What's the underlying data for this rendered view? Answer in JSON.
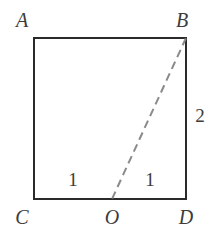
{
  "figure": {
    "background_color": "#ffffff",
    "stroke_color": "#2a2a2a",
    "dashed_stroke_color": "#8a8a8a",
    "label_color": "#3c3c3c",
    "square": {
      "x": 34,
      "y": 38,
      "width": 152,
      "height": 161,
      "stroke_width": 2.2
    },
    "dashed_segment": {
      "from": "B",
      "to": "O",
      "x1": 186,
      "y1": 38,
      "x2": 112,
      "y2": 199,
      "stroke_width": 2,
      "dash_length": 8,
      "gap_length": 5
    },
    "points": {
      "A": {
        "x": 34,
        "y": 38
      },
      "B": {
        "x": 186,
        "y": 38
      },
      "C": {
        "x": 34,
        "y": 199
      },
      "D": {
        "x": 186,
        "y": 199
      },
      "O": {
        "x": 112,
        "y": 199
      }
    }
  },
  "labels": {
    "A": "A",
    "B": "B",
    "C": "C",
    "D": "D",
    "O": "O"
  },
  "measures": {
    "side_right": "2",
    "segment_left": "1",
    "segment_right": "1"
  }
}
